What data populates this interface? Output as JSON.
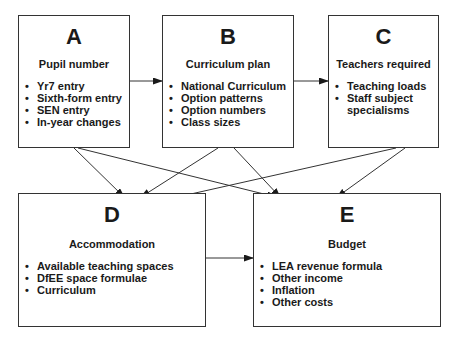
{
  "nodes": [
    {
      "id": "A",
      "letter": "A",
      "title": "Pupil number",
      "items": [
        "Yr7 entry",
        "Sixth-form entry",
        "SEN entry",
        "In-year changes"
      ]
    },
    {
      "id": "B",
      "letter": "B",
      "title": "Curriculum plan",
      "items": [
        "National Curriculum",
        "Option patterns",
        "Option numbers",
        "Class sizes"
      ]
    },
    {
      "id": "C",
      "letter": "C",
      "title": "Teachers required",
      "items": [
        "Teaching loads",
        "Staff subject specialisms"
      ]
    },
    {
      "id": "D",
      "letter": "D",
      "title": "Accommodation",
      "items": [
        "Available teaching spaces",
        "DfEE space formulae",
        "Curriculum"
      ]
    },
    {
      "id": "E",
      "letter": "E",
      "title": "Budget",
      "items": [
        "LEA revenue formula",
        "Other income",
        "Inflation",
        "Other costs"
      ]
    }
  ],
  "edges": [
    {
      "from": "A",
      "to": "B"
    },
    {
      "from": "B",
      "to": "C"
    },
    {
      "from": "A",
      "to": "D"
    },
    {
      "from": "A",
      "to": "E"
    },
    {
      "from": "B",
      "to": "D"
    },
    {
      "from": "B",
      "to": "E"
    },
    {
      "from": "C",
      "to": "D"
    },
    {
      "from": "C",
      "to": "E"
    },
    {
      "from": "D",
      "to": "E"
    }
  ]
}
